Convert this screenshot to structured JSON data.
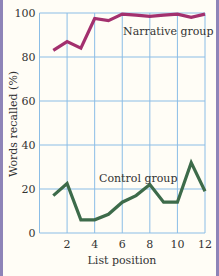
{
  "chart_data": {
    "type": "line",
    "title": "",
    "xlabel": "List position",
    "ylabel": "Words recalled (%)",
    "x": [
      1,
      2,
      3,
      4,
      5,
      6,
      7,
      8,
      9,
      10,
      11,
      12
    ],
    "x_ticks": [
      2,
      4,
      6,
      8,
      10,
      12
    ],
    "y_ticks": [
      0,
      20,
      40,
      60,
      80,
      100
    ],
    "xlim": [
      0,
      12
    ],
    "ylim": [
      0,
      100
    ],
    "grid": true,
    "series": [
      {
        "name": "Narrative group",
        "color": "#a3306e",
        "values": [
          83,
          87,
          84,
          97.5,
          96.5,
          99.5,
          99,
          98.5,
          99,
          99.5,
          98,
          99.5
        ]
      },
      {
        "name": "Control group",
        "color": "#3d6b4a",
        "values": [
          17,
          22.5,
          6,
          6,
          8.5,
          14,
          17,
          22,
          14,
          14,
          32,
          19
        ]
      }
    ],
    "annotations": [
      "Narrative group",
      "Control group"
    ],
    "colors": {
      "grid": "#8bbde6",
      "frame_border": "#8e84b8",
      "background": "#fffdf6"
    }
  }
}
